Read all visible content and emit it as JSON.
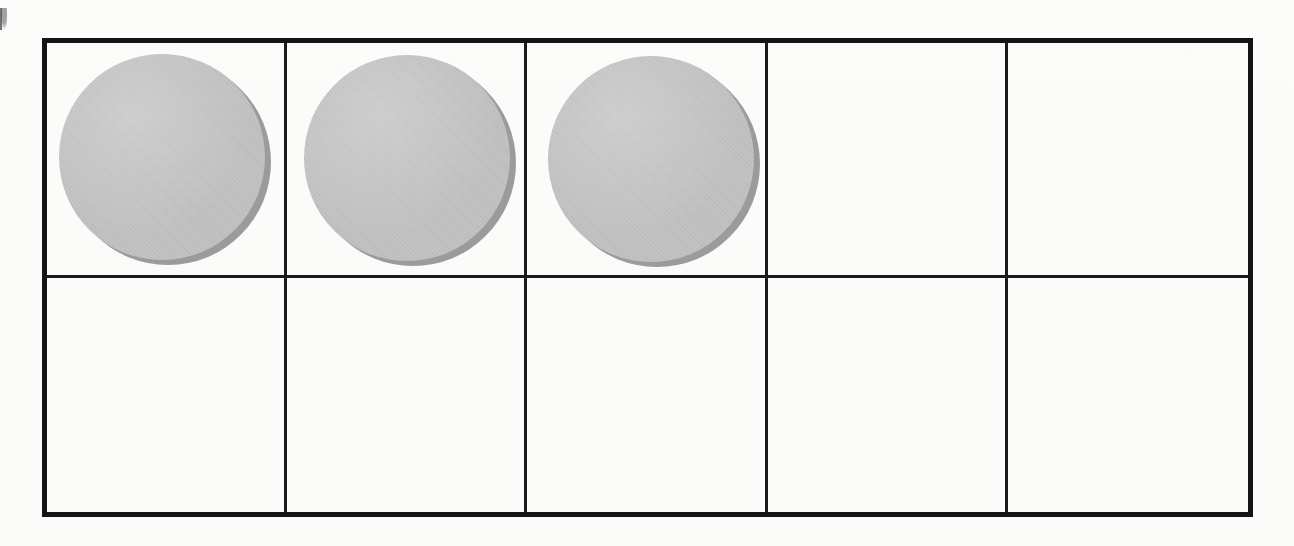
{
  "worksheet": {
    "type": "ten-frame",
    "title": "Ten frame with counters",
    "description": "A ten frame grid of 5 columns by 2 rows with three gray round counters filling the first three cells of the top row.",
    "background_color": "#fbfbfa",
    "border_color": "#141414",
    "grid_line_color": "#1a1a1a",
    "counter_fill_color": "#c2c2c2",
    "counter_shadow_color": "#9b9b9b"
  },
  "grid": {
    "columns": 5,
    "rows": 2,
    "total_cells": 10,
    "filled_count": 3,
    "empty_count": 7,
    "cells": [
      {
        "id": "cell-1",
        "row": 1,
        "column": 1,
        "filled": true,
        "counter_label": "counter-1"
      },
      {
        "id": "cell-2",
        "row": 1,
        "column": 2,
        "filled": true,
        "counter_label": "counter-2"
      },
      {
        "id": "cell-3",
        "row": 1,
        "column": 3,
        "filled": true,
        "counter_label": "counter-3"
      },
      {
        "id": "cell-4",
        "row": 1,
        "column": 4,
        "filled": false,
        "counter_label": ""
      },
      {
        "id": "cell-5",
        "row": 1,
        "column": 5,
        "filled": false,
        "counter_label": ""
      },
      {
        "id": "cell-6",
        "row": 2,
        "column": 1,
        "filled": false,
        "counter_label": ""
      },
      {
        "id": "cell-7",
        "row": 2,
        "column": 2,
        "filled": false,
        "counter_label": ""
      },
      {
        "id": "cell-8",
        "row": 2,
        "column": 3,
        "filled": false,
        "counter_label": ""
      },
      {
        "id": "cell-9",
        "row": 2,
        "column": 4,
        "filled": false,
        "counter_label": ""
      },
      {
        "id": "cell-10",
        "row": 2,
        "column": 5,
        "filled": false,
        "counter_label": ""
      }
    ]
  },
  "marks": {
    "edge_mark": "scanner-edge-mark"
  }
}
